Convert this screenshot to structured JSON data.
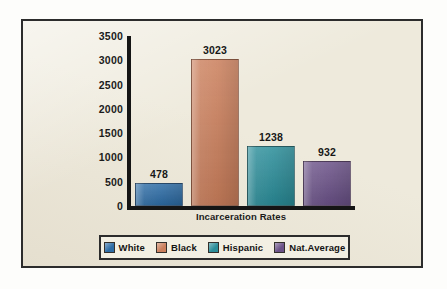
{
  "chart_data": {
    "type": "bar",
    "title": "",
    "subtitle": "",
    "xlabel": "Incarceration Rates",
    "ylabel": "",
    "categories": [
      "White",
      "Black",
      "Hispanic",
      "Nat.Average"
    ],
    "values": [
      478,
      3023,
      1238,
      932
    ],
    "data_labels": [
      "478",
      "3023",
      "1238",
      "932"
    ],
    "ylim": [
      0,
      3500
    ],
    "yticks": [
      3500,
      3000,
      2500,
      2000,
      1500,
      1000,
      500,
      0
    ],
    "ytick_labels": [
      "3500",
      "3000",
      "2500",
      "2000",
      "1500",
      "1000",
      "500",
      "0"
    ],
    "grid": false,
    "legend_position": "bottom",
    "series": [
      {
        "name": "Incarceration Rates",
        "values": [
          478,
          3023,
          1238,
          932
        ]
      }
    ],
    "colors": [
      "#2d6ca5",
      "#cb7f5c",
      "#2b8d99",
      "#6b5288"
    ]
  },
  "legend": {
    "items": [
      {
        "label": "White",
        "color": "#2d6ca5"
      },
      {
        "label": "Black",
        "color": "#cb7f5c"
      },
      {
        "label": "Hispanic",
        "color": "#2b8d99"
      },
      {
        "label": "Nat.Average",
        "color": "#6b5288"
      }
    ]
  },
  "axis": {
    "x_title": "Incarceration Rates",
    "ticks": [
      "3500",
      "3000",
      "2500",
      "2000",
      "1500",
      "1000",
      "500",
      "0"
    ]
  },
  "theme": {
    "panel_background": "#eeeadc",
    "panel_border": "#2c2c2c",
    "axis_color": "#151515",
    "text_color": "#171717",
    "page_background": "#fdfdfb"
  }
}
